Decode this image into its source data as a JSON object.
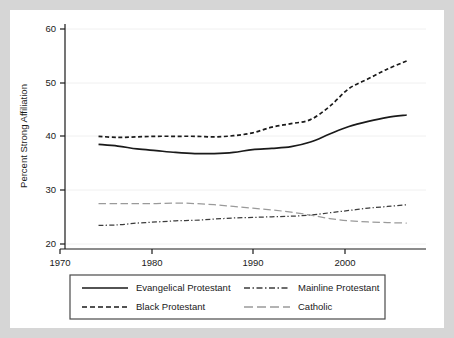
{
  "chart_data": {
    "type": "line",
    "title": "",
    "xlabel": "",
    "ylabel": "Percent Strong Affiliation",
    "xlim": [
      1970,
      2008
    ],
    "ylim": [
      20,
      60
    ],
    "xticks": [
      1970,
      1980,
      1990,
      2000
    ],
    "yticks": [
      20,
      30,
      40,
      50,
      60
    ],
    "xtick_labels": [
      "1970",
      "1980",
      "1990",
      "2000"
    ],
    "ytick_labels": [
      "20",
      "30",
      "40",
      "50",
      "60"
    ],
    "grid": "horizontal",
    "legend_position": "below-plot",
    "x": [
      1974,
      1976,
      1978,
      1980,
      1982,
      1984,
      1986,
      1988,
      1990,
      1992,
      1994,
      1996,
      1998,
      2000,
      2002,
      2004,
      2006
    ],
    "series": [
      {
        "name": "Evangelical Protestant",
        "style": "solid",
        "color": "#1a1a1a",
        "values": [
          38.2,
          37.9,
          37.4,
          37.1,
          36.8,
          36.6,
          36.6,
          36.8,
          37.3,
          37.5,
          37.8,
          38.6,
          40.0,
          41.3,
          42.2,
          42.9,
          43.3
        ]
      },
      {
        "name": "Black Protestant",
        "style": "dashed",
        "color": "#1a1a1a",
        "values": [
          39.6,
          39.4,
          39.5,
          39.6,
          39.6,
          39.6,
          39.5,
          39.7,
          40.2,
          41.2,
          41.8,
          42.5,
          44.8,
          47.9,
          49.6,
          51.3,
          52.7
        ]
      },
      {
        "name": "Mainline Protestant",
        "style": "dash-dot",
        "color": "#3c3c3c",
        "values": [
          24.1,
          24.2,
          24.5,
          24.7,
          24.9,
          25.0,
          25.2,
          25.4,
          25.5,
          25.6,
          25.7,
          25.9,
          26.3,
          26.7,
          27.1,
          27.4,
          27.7
        ]
      },
      {
        "name": "Catholic",
        "style": "long-dash",
        "color": "#9a9a9a",
        "values": [
          27.9,
          27.9,
          27.9,
          27.9,
          28.0,
          27.9,
          27.7,
          27.4,
          27.1,
          26.8,
          26.4,
          25.9,
          25.3,
          24.9,
          24.7,
          24.6,
          24.5
        ]
      }
    ],
    "legend": [
      {
        "label": "Evangelical Protestant",
        "style": "solid"
      },
      {
        "label": "Mainline Protestant",
        "style": "dash-dot"
      },
      {
        "label": "Black Protestant",
        "style": "dashed"
      },
      {
        "label": "Catholic",
        "style": "long-dash"
      }
    ],
    "colors": {
      "axis": "#1a1a1a",
      "grid": "#f0f0f0",
      "plot_background": "#ffffff",
      "figure_background": "#ffffff",
      "page_background": "#d6d6d6",
      "legend_border": "#4a4a4a"
    }
  }
}
